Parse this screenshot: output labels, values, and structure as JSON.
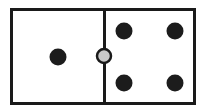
{
  "figure": {
    "name": "domino-tile",
    "caption": "Domino tile showing one pip on the left half and four pips on the right half with a round pivot marker on the dividing line",
    "background_color": "#ffffff"
  },
  "tile": {
    "outline_color": "#1a1a1a",
    "fill_color": "#ffffff",
    "border_width": 3,
    "x": 11,
    "y": 9,
    "width": 183,
    "height": 94
  },
  "divider": {
    "name": "center-divider-line",
    "color": "#1a1a1a",
    "width": 3,
    "x": 104,
    "y_top": 9,
    "y_bottom": 103
  },
  "pivot": {
    "name": "center-pivot-circle",
    "fill_color": "#c9c9c9",
    "stroke_color": "#1a1a1a",
    "stroke_width": 2.5,
    "cx": 104,
    "cy": 56,
    "r": 7
  },
  "pips": {
    "color": "#1c1c1c",
    "radius": 8.5,
    "left_half": {
      "name": "left-half",
      "count": 1,
      "points": [
        {
          "name": "pip-left-center",
          "cx": 58,
          "cy": 57
        }
      ]
    },
    "right_half": {
      "name": "right-half",
      "count": 4,
      "points": [
        {
          "name": "pip-right-top-left",
          "cx": 124,
          "cy": 31
        },
        {
          "name": "pip-right-top-right",
          "cx": 175,
          "cy": 31
        },
        {
          "name": "pip-right-bottom-left",
          "cx": 124,
          "cy": 83
        },
        {
          "name": "pip-right-bottom-right",
          "cx": 175,
          "cy": 83
        }
      ]
    }
  }
}
